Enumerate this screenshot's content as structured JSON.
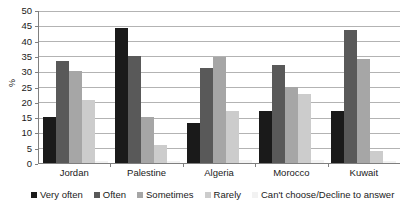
{
  "chart_data": {
    "type": "bar",
    "title": "",
    "xlabel": "",
    "ylabel": "%",
    "ylim": [
      0,
      50
    ],
    "yticks": [
      0,
      5,
      10,
      15,
      20,
      25,
      30,
      35,
      40,
      45,
      50
    ],
    "grid": true,
    "legend_position": "bottom",
    "categories": [
      "Jordan",
      "Palestine",
      "Algeria",
      "Morocco",
      "Kuwait"
    ],
    "series": [
      {
        "name": "Very often",
        "color": "#1a1a1a",
        "values": [
          15,
          44,
          13,
          17,
          17
        ]
      },
      {
        "name": "Often",
        "color": "#595959",
        "values": [
          33.5,
          35,
          31,
          32,
          43.5
        ]
      },
      {
        "name": "Sometimes",
        "color": "#a6a6a6",
        "values": [
          30,
          15,
          34.5,
          25,
          34
        ]
      },
      {
        "name": "Rarely",
        "color": "#cccccc",
        "values": [
          20.5,
          6,
          17,
          22.5,
          4
        ]
      },
      {
        "name": "Can't choose/Decline to answer",
        "color": "#f2f2f2",
        "values": [
          0.5,
          0.5,
          1,
          1,
          0.5
        ]
      }
    ]
  },
  "axis": {
    "y_title": "%"
  },
  "colors": {
    "gridline": "#b3b3b3",
    "axis": "#7f7f7f",
    "background": "#ffffff",
    "text": "#1a1a1a"
  }
}
